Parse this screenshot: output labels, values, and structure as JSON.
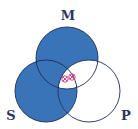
{
  "diagram": {
    "type": "venn-3",
    "colors": {
      "shade": "#3a74b8",
      "outline": "#1f2d55",
      "label": "#2a3560",
      "mark": "#d0307a",
      "background": "#ffffff"
    },
    "circles": [
      {
        "id": "M",
        "label": "M",
        "cx": 67,
        "cy": 58,
        "r": 31
      },
      {
        "id": "S",
        "label": "S",
        "cx": 46,
        "cy": 91,
        "r": 31
      },
      {
        "id": "P",
        "label": "P",
        "cx": 89,
        "cy": 91,
        "r": 31
      }
    ],
    "labels": {
      "M": "M",
      "S": "S",
      "P": "P"
    },
    "shaded_regions": [
      "M only",
      "S only",
      "M∩S only",
      "S∩P only"
    ],
    "unshaded_regions": [
      "P only",
      "M∩P only",
      "M∩S∩P"
    ],
    "marks": [
      {
        "symbol": "⊗",
        "x": 65,
        "y": 79
      },
      {
        "symbol": "⊗",
        "x": 72,
        "y": 77
      }
    ]
  }
}
